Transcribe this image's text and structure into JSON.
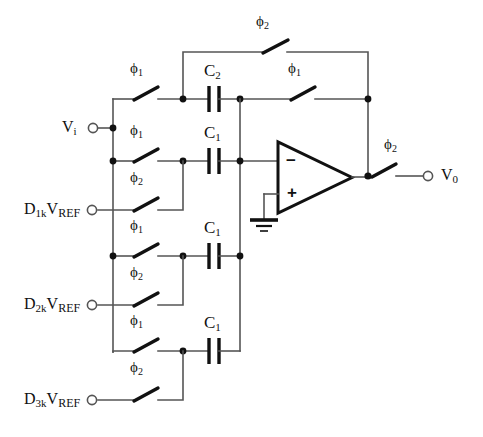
{
  "figure": {
    "type": "circuit-schematic",
    "background_color": "#ffffff",
    "wire_color": "#555555",
    "ink_color": "#111111"
  },
  "terminals": [
    {
      "id": "vi",
      "label_main": "V",
      "label_sub": "i",
      "name": "Vi",
      "x": 93,
      "y": 128
    },
    {
      "id": "d1k",
      "label_main": "D",
      "label_sub": "1k",
      "label_tail": "V",
      "label_tail_sub": "REF",
      "name": "D1kVREF",
      "x": 92,
      "y": 210
    },
    {
      "id": "d2k",
      "label_main": "D",
      "label_sub": "2k",
      "label_tail": "V",
      "label_tail_sub": "REF",
      "name": "D2kVREF",
      "x": 92,
      "y": 305
    },
    {
      "id": "d3k",
      "label_main": "D",
      "label_sub": "3k",
      "label_tail": "V",
      "label_tail_sub": "REF",
      "name": "D3kVREF",
      "x": 92,
      "y": 400
    },
    {
      "id": "vo",
      "label_main": "V",
      "label_sub": "0",
      "name": "V0",
      "x": 428,
      "y": 175
    }
  ],
  "terminal_labels": {
    "vi": {
      "main": "V",
      "sub": "i"
    },
    "d1k": {
      "main": "D",
      "sub": "1k",
      "tail": "V",
      "tail_sub": "REF"
    },
    "d2k": {
      "main": "D",
      "sub": "2k",
      "tail": "V",
      "tail_sub": "REF"
    },
    "d3k": {
      "main": "D",
      "sub": "3k",
      "tail": "V",
      "tail_sub": "REF"
    },
    "vo": {
      "main": "V",
      "sub": "0"
    }
  },
  "capacitors": [
    {
      "id": "c2",
      "main": "C",
      "sub": "2",
      "x": 214,
      "y": 99,
      "label_x": 204,
      "label_y": 68,
      "role": "feedback-capacitor"
    },
    {
      "id": "c1_a",
      "main": "C",
      "sub": "1",
      "x": 214,
      "y": 161,
      "label_x": 204,
      "label_y": 130,
      "role": "sampling-capacitor"
    },
    {
      "id": "c1_b",
      "main": "C",
      "sub": "1",
      "x": 214,
      "y": 256,
      "label_x": 204,
      "label_y": 225,
      "role": "sampling-capacitor"
    },
    {
      "id": "c1_c",
      "main": "C",
      "sub": "1",
      "x": 214,
      "y": 351,
      "label_x": 204,
      "label_y": 320,
      "role": "sampling-capacitor"
    }
  ],
  "switches": [
    {
      "id": "sw_top_fb",
      "phase": "2",
      "label_x": 256,
      "label_y": 22,
      "name": "phi2-reset-switch-c2"
    },
    {
      "id": "sw_vi_c2",
      "phase": "1",
      "label_x": 130,
      "label_y": 69,
      "name": "phi1-switch-vi-to-c2"
    },
    {
      "id": "sw_fb_out",
      "phase": "1",
      "label_x": 288,
      "label_y": 69,
      "name": "phi1-switch-c2-to-output"
    },
    {
      "id": "sw_vi_c1a",
      "phase": "1",
      "label_x": 130,
      "label_y": 131,
      "name": "phi1-switch-vi-to-c1a"
    },
    {
      "id": "sw_d1k",
      "phase": "2",
      "label_x": 130,
      "label_y": 178,
      "name": "phi2-switch-d1k"
    },
    {
      "id": "sw_vi_c1b",
      "phase": "1",
      "label_x": 130,
      "label_y": 226,
      "name": "phi1-switch-vi-to-c1b"
    },
    {
      "id": "sw_d2k",
      "phase": "2",
      "label_x": 130,
      "label_y": 273,
      "name": "phi2-switch-d2k"
    },
    {
      "id": "sw_vi_c1c",
      "phase": "1",
      "label_x": 130,
      "label_y": 321,
      "name": "phi1-switch-vi-to-c1c"
    },
    {
      "id": "sw_d3k",
      "phase": "2",
      "label_x": 130,
      "label_y": 368,
      "name": "phi2-switch-d3k"
    },
    {
      "id": "sw_out",
      "phase": "2",
      "label_x": 384,
      "label_y": 145,
      "name": "phi2-output-switch"
    }
  ],
  "phase_symbol": "ϕ",
  "opamp": {
    "name": "operational-amplifier",
    "inverting_input_symbol": "−",
    "noninverting_input_symbol": "+",
    "inv_x": 289,
    "inv_y": 161,
    "non_x": 289,
    "non_y": 194,
    "ground_label": "ground"
  }
}
